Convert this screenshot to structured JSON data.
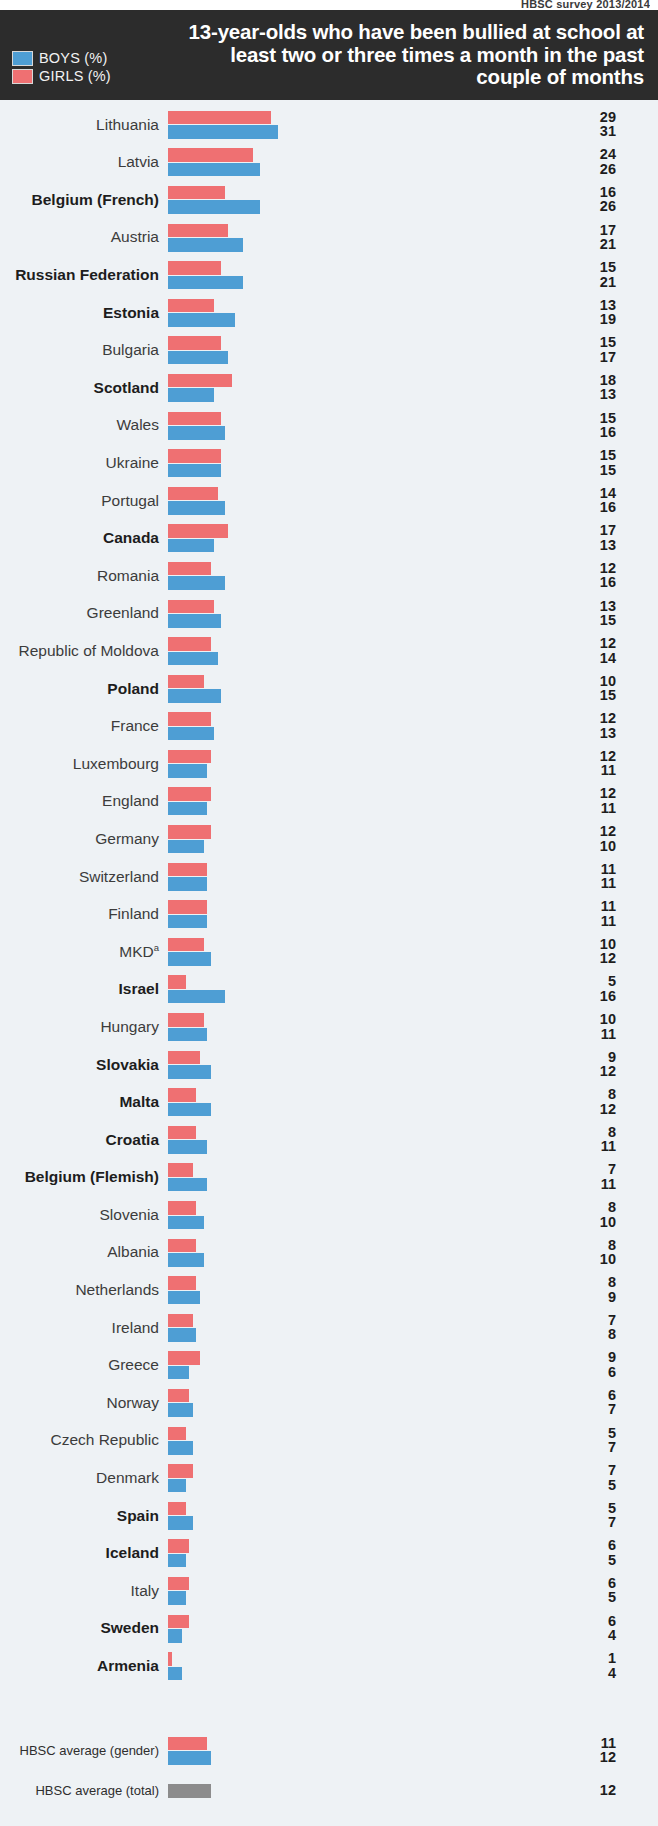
{
  "source_note": "HBSC survey 2013/2014",
  "header": {
    "title": "13-year-olds who have been bullied at school at least two or three times a month in the past couple of months",
    "legend": [
      {
        "label": "BOYS (%)",
        "color": "#4e9ed4",
        "key": "boys"
      },
      {
        "label": "GIRLS (%)",
        "color": "#ef7072",
        "key": "girls"
      }
    ]
  },
  "chart_data": {
    "type": "bar",
    "orientation": "horizontal",
    "title": "13-year-olds who have been bullied at school at least two or three times a month in the past couple of months",
    "xlabel": "",
    "ylabel": "",
    "xlim": [
      0,
      35
    ],
    "grid": false,
    "legend_position": "top-left",
    "note": "Values shown as percentages. Girls bar is drawn above Boys bar in each pair.",
    "categories": [
      "Lithuania",
      "Latvia",
      "Belgium (French)",
      "Austria",
      "Russian Federation",
      "Estonia",
      "Bulgaria",
      "Scotland",
      "Wales",
      "Ukraine",
      "Portugal",
      "Canada",
      "Romania",
      "Greenland",
      "Republic of Moldova",
      "Poland",
      "France",
      "Luxembourg",
      "England",
      "Germany",
      "Switzerland",
      "Finland",
      "MKD",
      "Israel",
      "Hungary",
      "Slovakia",
      "Malta",
      "Croatia",
      "Belgium (Flemish)",
      "Slovenia",
      "Albania",
      "Netherlands",
      "Ireland",
      "Greece",
      "Norway",
      "Czech Republic",
      "Denmark",
      "Spain",
      "Iceland",
      "Italy",
      "Sweden",
      "Armenia"
    ],
    "series": [
      {
        "name": "GIRLS (%)",
        "color": "#ef7072",
        "values": [
          29,
          24,
          16,
          17,
          15,
          13,
          15,
          18,
          15,
          15,
          14,
          17,
          12,
          13,
          12,
          10,
          12,
          12,
          12,
          12,
          11,
          11,
          10,
          5,
          10,
          9,
          8,
          8,
          7,
          8,
          8,
          8,
          7,
          9,
          6,
          5,
          7,
          5,
          6,
          6,
          6,
          1
        ]
      },
      {
        "name": "BOYS (%)",
        "color": "#4e9ed4",
        "values": [
          31,
          26,
          26,
          21,
          21,
          19,
          17,
          13,
          16,
          15,
          16,
          13,
          16,
          15,
          14,
          15,
          13,
          11,
          11,
          10,
          11,
          11,
          12,
          16,
          11,
          12,
          12,
          11,
          11,
          10,
          10,
          9,
          8,
          6,
          7,
          7,
          5,
          7,
          5,
          5,
          4,
          4
        ]
      }
    ],
    "averages": [
      {
        "label": "HBSC average (gender)",
        "girls": 11,
        "boys": 12
      },
      {
        "label": "HBSC average (total)",
        "total": 12,
        "color": "#8c8c8c"
      }
    ]
  },
  "rows": [
    {
      "label": "Lithuania",
      "bold": false,
      "girls": 29,
      "boys": 31
    },
    {
      "label": "Latvia",
      "bold": false,
      "girls": 24,
      "boys": 26
    },
    {
      "label": "Belgium (French)",
      "bold": true,
      "girls": 16,
      "boys": 26
    },
    {
      "label": "Austria",
      "bold": false,
      "girls": 17,
      "boys": 21
    },
    {
      "label": "Russian Federation",
      "bold": true,
      "girls": 15,
      "boys": 21
    },
    {
      "label": "Estonia",
      "bold": true,
      "girls": 13,
      "boys": 19
    },
    {
      "label": "Bulgaria",
      "bold": false,
      "girls": 15,
      "boys": 17
    },
    {
      "label": "Scotland",
      "bold": true,
      "girls": 18,
      "boys": 13
    },
    {
      "label": "Wales",
      "bold": false,
      "girls": 15,
      "boys": 16
    },
    {
      "label": "Ukraine",
      "bold": false,
      "girls": 15,
      "boys": 15
    },
    {
      "label": "Portugal",
      "bold": false,
      "girls": 14,
      "boys": 16
    },
    {
      "label": "Canada",
      "bold": true,
      "girls": 17,
      "boys": 13
    },
    {
      "label": "Romania",
      "bold": false,
      "girls": 12,
      "boys": 16
    },
    {
      "label": "Greenland",
      "bold": false,
      "girls": 13,
      "boys": 15
    },
    {
      "label": "Republic of Moldova",
      "bold": false,
      "girls": 12,
      "boys": 14
    },
    {
      "label": "Poland",
      "bold": true,
      "girls": 10,
      "boys": 15
    },
    {
      "label": "France",
      "bold": false,
      "girls": 12,
      "boys": 13
    },
    {
      "label": "Luxembourg",
      "bold": false,
      "girls": 12,
      "boys": 11
    },
    {
      "label": "England",
      "bold": false,
      "girls": 12,
      "boys": 11
    },
    {
      "label": "Germany",
      "bold": false,
      "girls": 12,
      "boys": 10
    },
    {
      "label": "Switzerland",
      "bold": false,
      "girls": 11,
      "boys": 11
    },
    {
      "label": "Finland",
      "bold": false,
      "girls": 11,
      "boys": 11
    },
    {
      "label": "MKD",
      "bold": false,
      "sup": "a",
      "girls": 10,
      "boys": 12
    },
    {
      "label": "Israel",
      "bold": true,
      "girls": 5,
      "boys": 16
    },
    {
      "label": "Hungary",
      "bold": false,
      "girls": 10,
      "boys": 11
    },
    {
      "label": "Slovakia",
      "bold": true,
      "girls": 9,
      "boys": 12
    },
    {
      "label": "Malta",
      "bold": true,
      "girls": 8,
      "boys": 12
    },
    {
      "label": "Croatia",
      "bold": true,
      "girls": 8,
      "boys": 11
    },
    {
      "label": "Belgium (Flemish)",
      "bold": true,
      "girls": 7,
      "boys": 11
    },
    {
      "label": "Slovenia",
      "bold": false,
      "girls": 8,
      "boys": 10
    },
    {
      "label": "Albania",
      "bold": false,
      "girls": 8,
      "boys": 10
    },
    {
      "label": "Netherlands",
      "bold": false,
      "girls": 8,
      "boys": 9
    },
    {
      "label": "Ireland",
      "bold": false,
      "girls": 7,
      "boys": 8
    },
    {
      "label": "Greece",
      "bold": false,
      "girls": 9,
      "boys": 6
    },
    {
      "label": "Norway",
      "bold": false,
      "girls": 6,
      "boys": 7
    },
    {
      "label": "Czech Republic",
      "bold": false,
      "girls": 5,
      "boys": 7
    },
    {
      "label": "Denmark",
      "bold": false,
      "girls": 7,
      "boys": 5
    },
    {
      "label": "Spain",
      "bold": true,
      "girls": 5,
      "boys": 7
    },
    {
      "label": "Iceland",
      "bold": true,
      "girls": 6,
      "boys": 5
    },
    {
      "label": "Italy",
      "bold": false,
      "girls": 6,
      "boys": 5
    },
    {
      "label": "Sweden",
      "bold": true,
      "girls": 6,
      "boys": 4
    },
    {
      "label": "Armenia",
      "bold": true,
      "girls": 1,
      "boys": 4
    }
  ],
  "averages": {
    "gender": {
      "label": "HBSC average (gender)",
      "girls": 11,
      "boys": 12
    },
    "total": {
      "label": "HBSC average (total)",
      "value": 12
    }
  },
  "scale": {
    "px_per_unit": 3.55,
    "max": 35
  }
}
